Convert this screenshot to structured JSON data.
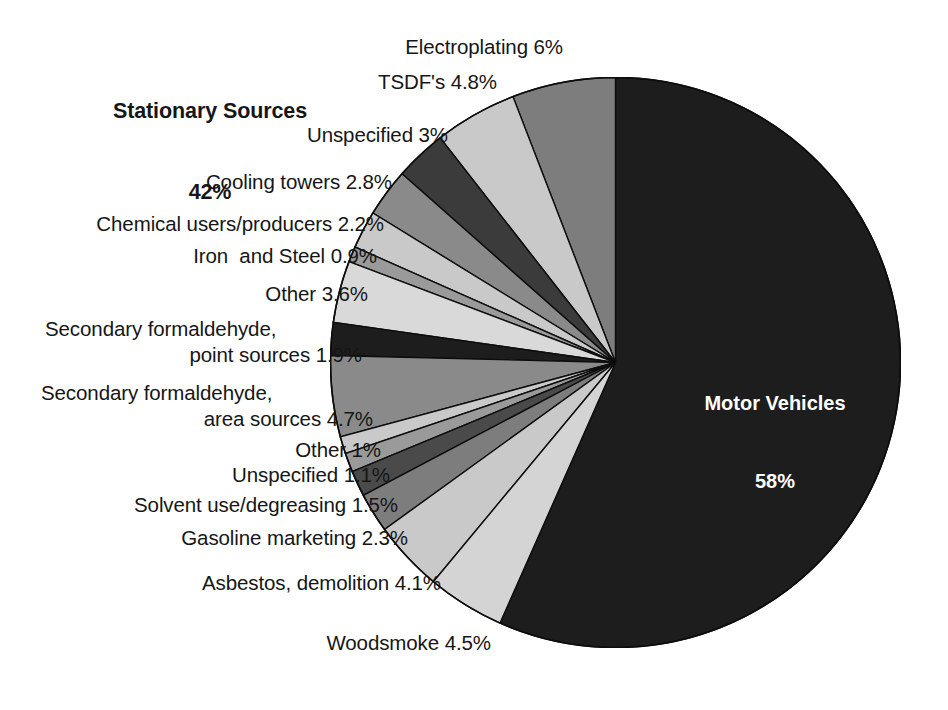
{
  "chart_data": {
    "type": "pie",
    "title": "",
    "note": "Shares of total; Motor Vehicles 58% vs Stationary Sources 42%",
    "start_angle_deg": 0,
    "direction": "clockwise-for-motor-vehicles, counter-clockwise-for-stationary",
    "labels": [
      "Motor Vehicles",
      "Electroplating",
      "TSDF's",
      "Unspecified",
      "Cooling towers",
      "Chemical users/producers",
      "Iron  and Steel",
      "Other",
      "Secondary formaldehyde, point sources",
      "Secondary formaldehyde, area sources",
      "Other",
      "Unspecified",
      "Solvent use/degreasing",
      "Gasoline marketing",
      "Asbestos, demolition",
      "Woodsmoke"
    ],
    "values": [
      58,
      6,
      4.8,
      3,
      2.8,
      2.2,
      0.9,
      3.6,
      1.9,
      4.7,
      1,
      1.1,
      1.5,
      2.3,
      4.1,
      4.5
    ],
    "value_texts": [
      "58%",
      "6%",
      "4.8%",
      "3%",
      "2.8%",
      "2.2%",
      "0.9%",
      "3.6%",
      "1.9%",
      "4.7%",
      "1%",
      "1.1%",
      "1.5%",
      "2.3%",
      "4.1%",
      "4.5%"
    ],
    "colors": [
      "#1d1d1d",
      "#7d7d7d",
      "#c9c9c9",
      "#3b3b3b",
      "#8a8a8a",
      "#c9c9c9",
      "#9a9a9a",
      "#d9d9d9",
      "#1d1d1d",
      "#8a8a8a",
      "#c9c9c9",
      "#9a9a9a",
      "#4a4a4a",
      "#7d7d7d",
      "#c9c9c9",
      "#d4d4d4"
    ],
    "groups": [
      {
        "name": "Motor Vehicles",
        "value": 58,
        "text": "58%"
      },
      {
        "name": "Stationary Sources",
        "value": 42,
        "text": "42%"
      }
    ]
  },
  "heading": {
    "line1": "Stationary Sources",
    "line2": "42%"
  },
  "center_label": {
    "line1": "Motor Vehicles",
    "line2": "58%"
  },
  "labels": {
    "electroplating": "Electroplating 6%",
    "tsdf": "TSDF's 4.8%",
    "unspecified_top": "Unspecified 3%",
    "cooling_towers": "Cooling towers 2.8%",
    "chemical_users": "Chemical users/producers 2.2%",
    "iron_steel": "Iron  and Steel 0.9%",
    "other_top": "Other 3.6%",
    "sec_form_point_1": "Secondary formaldehyde,",
    "sec_form_point_2": "point sources 1.9%",
    "sec_form_area_1": "Secondary formaldehyde,",
    "sec_form_area_2": "area sources 4.7%",
    "other_bottom": "Other 1%",
    "unspecified_bottom": "Unspecified 1.1%",
    "solvent": "Solvent use/degreasing 1.5%",
    "gasoline": "Gasoline marketing 2.3%",
    "asbestos": "Asbestos, demolition 4.1%",
    "woodsmoke": "Woodsmoke 4.5%"
  }
}
